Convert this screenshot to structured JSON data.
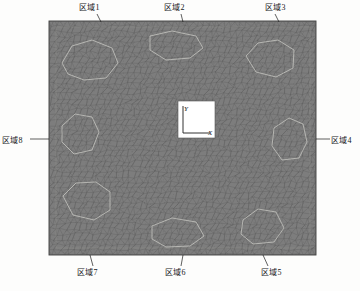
{
  "figure": {
    "type": "finite-element-mesh-diagram",
    "mesh": {
      "x": 49,
      "y": 21,
      "width": 267,
      "height": 234,
      "fill_color": "#7d7d7d",
      "edge_color": "#5a5a5a",
      "border_color": "#4a4a4a",
      "highlight_color": "#c9c9c4"
    },
    "background_color": "#fdfdfc",
    "text_color": "#15171a"
  },
  "axis_inset": {
    "x": 178,
    "y": 101,
    "width": 37,
    "height": 37,
    "fill_color": "#ffffff",
    "x_axis_label": "X",
    "y_axis_label": "Y"
  },
  "zone_labels": [
    {
      "id": "zone-1",
      "text": "区域1",
      "lx": 79,
      "ly": 3,
      "anchor": "start",
      "leader": [
        [
          97,
          14
        ],
        [
          101,
          22
        ]
      ]
    },
    {
      "id": "zone-2",
      "text": "区域2",
      "lx": 164,
      "ly": 3,
      "anchor": "start",
      "leader": [
        [
          181,
          14
        ],
        [
          183,
          22
        ]
      ]
    },
    {
      "id": "zone-3",
      "text": "区域3",
      "lx": 265,
      "ly": 3,
      "anchor": "start",
      "leader": [
        [
          275,
          14
        ],
        [
          279,
          22
        ]
      ]
    },
    {
      "id": "zone-4",
      "text": "区域4",
      "lx": 331,
      "ly": 136,
      "anchor": "start",
      "leader": [
        [
          316,
          139
        ],
        [
          330,
          139
        ]
      ]
    },
    {
      "id": "zone-5",
      "text": "区域5",
      "lx": 261,
      "ly": 268,
      "anchor": "start",
      "leader": [
        [
          268,
          266
        ],
        [
          263,
          255
        ]
      ]
    },
    {
      "id": "zone-6",
      "text": "区域6",
      "lx": 165,
      "ly": 268,
      "anchor": "start",
      "leader": [
        [
          181,
          266
        ],
        [
          183,
          255
        ]
      ]
    },
    {
      "id": "zone-7",
      "text": "区域7",
      "lx": 77,
      "ly": 268,
      "anchor": "start",
      "leader": [
        [
          93,
          266
        ],
        [
          90,
          255
        ]
      ]
    },
    {
      "id": "zone-8",
      "text": "区域8",
      "lx": 2,
      "ly": 136,
      "anchor": "start",
      "leader": [
        [
          30,
          139
        ],
        [
          49,
          139
        ]
      ]
    }
  ],
  "zone_boundaries": [
    {
      "name": "zone-1-region",
      "points": "62,63 72,46 92,40 112,48 118,63 106,78 84,80 68,74"
    },
    {
      "name": "zone-2-region",
      "points": "150,36 172,31 196,36 203,48 190,58 166,60 150,50"
    },
    {
      "name": "zone-3-region",
      "points": "246,56 258,43 278,40 294,50 293,68 276,77 256,72"
    },
    {
      "name": "zone-4-region",
      "points": "274,128 289,118 303,124 307,142 299,158 282,160 272,146"
    },
    {
      "name": "zone-5-region",
      "points": "243,220 258,209 276,212 284,228 274,242 253,244 241,234"
    },
    {
      "name": "zone-6-region",
      "points": "152,226 172,218 196,222 204,236 190,246 166,247 152,239"
    },
    {
      "name": "zone-7-region",
      "points": "63,196 76,183 96,182 110,192 110,210 94,220 73,215"
    },
    {
      "name": "zone-8-region",
      "points": "62,126 75,114 92,117 99,132 92,150 74,154 62,142"
    }
  ]
}
